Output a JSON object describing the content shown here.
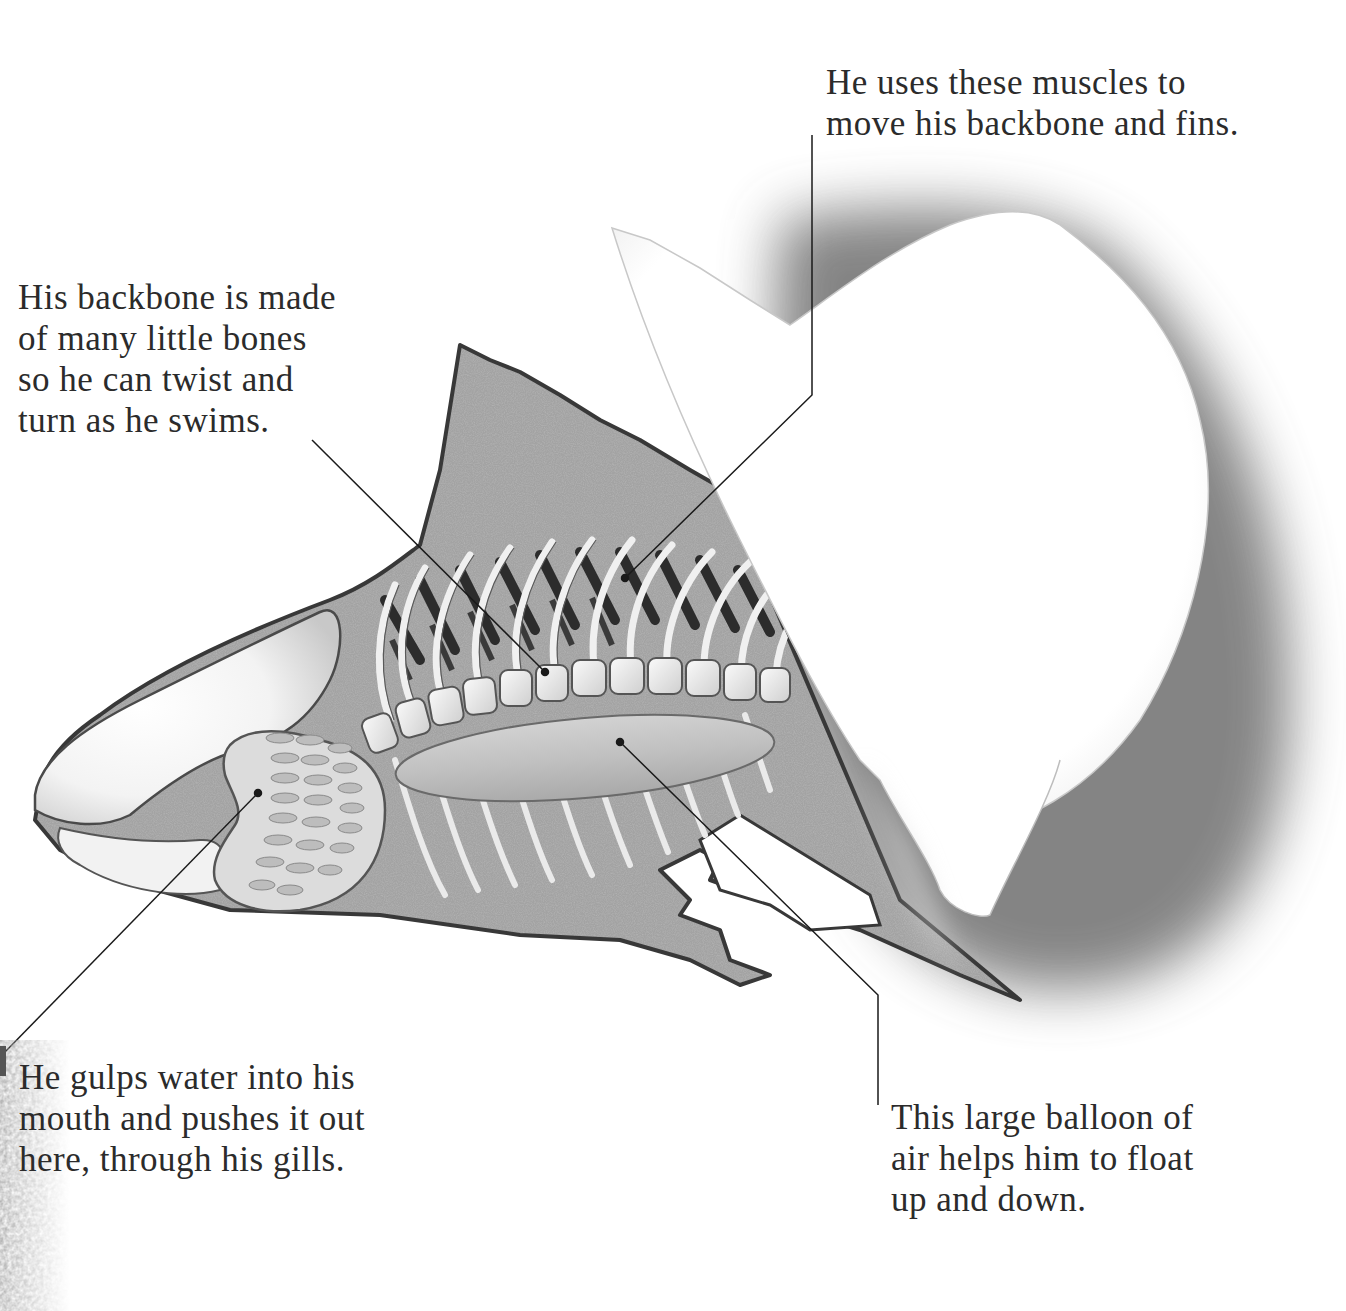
{
  "diagram": {
    "colors": {
      "body_fill": "#9a9a9a",
      "outline": "#3a3a3a",
      "muscle_band": "#2e2e2e",
      "bone": "#ececec",
      "swim_bladder": "#c4c4c4",
      "flap_shadow": "#6e6e6e",
      "leader_line": "#1a1a1a",
      "text": "#2b2b2b"
    },
    "parts": [
      {
        "id": "backbone",
        "name": "Backbone (vertebrae)"
      },
      {
        "id": "muscles",
        "name": "Muscles"
      },
      {
        "id": "gills",
        "name": "Gills"
      },
      {
        "id": "swim-bladder",
        "name": "Swim bladder"
      },
      {
        "id": "skin-flap",
        "name": "Lifted skin flap"
      }
    ]
  },
  "labels": {
    "muscles": {
      "lines": [
        "He uses these muscles to",
        "move his backbone and fins."
      ]
    },
    "backbone": {
      "lines": [
        "His backbone is made",
        "of many little bones",
        "so he can twist and",
        "turn as he swims."
      ]
    },
    "gills": {
      "lines": [
        "He gulps water into his",
        "mouth and pushes it out",
        "here, through his gills."
      ]
    },
    "swim_bladder": {
      "lines": [
        "This large balloon of",
        "air helps him to float",
        "up and down."
      ]
    }
  }
}
